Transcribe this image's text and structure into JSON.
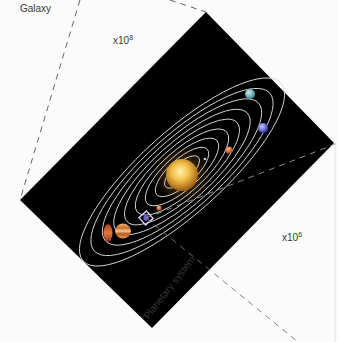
{
  "labels": {
    "galaxy": "Galaxy",
    "planetary_system": "Planetary system",
    "scale_galaxy_base": "x10",
    "scale_galaxy_exp": "8",
    "scale_system_base": "x10",
    "scale_system_exp": "6"
  },
  "colors": {
    "background": "#fbfbfb",
    "space": "#000000",
    "orbit": "#d8d8d8",
    "dash": "#555555",
    "sun_core": "#ffe27a",
    "sun_edge": "#c98a1a",
    "highlight_box": "#c9c4f0"
  },
  "diagram": {
    "space_panel_corners": [
      [
        206,
        12
      ],
      [
        334,
        143
      ],
      [
        152,
        328
      ],
      [
        20,
        200
      ]
    ],
    "sun": {
      "cx": 182,
      "cy": 175,
      "r": 16
    },
    "orbit_count": 9,
    "planets": [
      {
        "name": "cyan-planet",
        "color": "#6fb3b3"
      },
      {
        "name": "blue-planet",
        "color": "#6a6fe0"
      },
      {
        "name": "orange-planet",
        "color": "#d7702e"
      },
      {
        "name": "small-inner-planet",
        "color": "#d8874a"
      },
      {
        "name": "highlighted-planet",
        "color": "#6d5bd3"
      },
      {
        "name": "banded-gas-giant",
        "color": "#d58b47"
      },
      {
        "name": "red-gas-giant",
        "color": "#b8502a"
      }
    ]
  }
}
